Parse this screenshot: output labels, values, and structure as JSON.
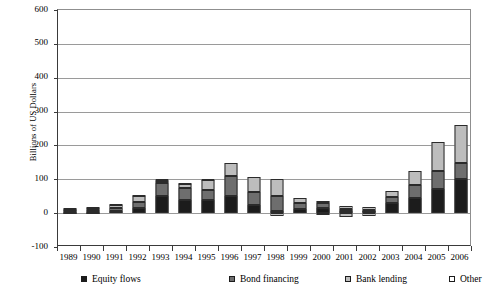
{
  "chart_data": {
    "type": "bar",
    "subtype": "stacked-bar",
    "title": "",
    "xlabel": "",
    "ylabel": "Billions of US Dollars",
    "ylim": [
      -100,
      600
    ],
    "yticks": [
      600,
      500,
      400,
      300,
      200,
      100,
      0,
      -100
    ],
    "ytick_labels": [
      "600",
      "500",
      "400",
      "300",
      "200",
      "100",
      "0",
      "-100"
    ],
    "grid": true,
    "legend_position": "bottom",
    "categories": [
      "1989",
      "1990",
      "1991",
      "1992",
      "1993",
      "1994",
      "1995",
      "1996",
      "1997",
      "1998",
      "1999",
      "2000",
      "2001",
      "2002",
      "2003",
      "2004",
      "2005",
      "2006"
    ],
    "series": [
      {
        "name": "Equity flows",
        "color": "#1c1c1c",
        "values": [
          3,
          3,
          7,
          14,
          52,
          38,
          38,
          52,
          24,
          5,
          13,
          15,
          5,
          5,
          29,
          44,
          72,
          101
        ]
      },
      {
        "name": "Bond financing",
        "color": "#6e6e6e",
        "values": [
          5,
          5,
          8,
          20,
          36,
          37,
          30,
          58,
          38,
          46,
          18,
          14,
          6,
          4,
          20,
          40,
          52,
          48
        ]
      },
      {
        "name": "Bank lending",
        "color": "#bdbdbd",
        "values": [
          4,
          8,
          10,
          16,
          8,
          10,
          30,
          38,
          44,
          49,
          14,
          7,
          10,
          10,
          17,
          39,
          87,
          111
        ]
      },
      {
        "name": "Other",
        "color": "#f2f2f2",
        "values": [
          2,
          2,
          2,
          3,
          4,
          3,
          2,
          0,
          0,
          0,
          0,
          0,
          0,
          0,
          0,
          0,
          0,
          0
        ]
      }
    ],
    "negative_series": [
      {
        "name": "Bank lending",
        "values_negative": [
          0,
          0,
          0,
          0,
          0,
          0,
          0,
          0,
          0,
          -9,
          0,
          -3,
          -12,
          -7,
          0,
          0,
          0,
          0
        ]
      }
    ],
    "totals": [
      14,
      18,
      27,
      53,
      100,
      88,
      100,
      148,
      106,
      100,
      45,
      36,
      21,
      19,
      66,
      123,
      211,
      260
    ]
  },
  "legend": {
    "items": [
      {
        "label": "Equity flows",
        "swatch": "equity"
      },
      {
        "label": "Bond financing",
        "swatch": "bond"
      },
      {
        "label": "Bank lending",
        "swatch": "bank"
      },
      {
        "label": "Other",
        "swatch": "other"
      }
    ]
  },
  "axes": {
    "y_title": "Billions of US Dollars"
  }
}
